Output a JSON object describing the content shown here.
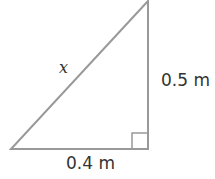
{
  "diagram": {
    "type": "right-triangle",
    "line_color": "#999999",
    "vertices": {
      "top": [
        148,
        1
      ],
      "bottom_left": [
        11,
        149
      ],
      "bottom_right": [
        148,
        149
      ]
    },
    "right_angle_at": "bottom_right",
    "labels": {
      "hypotenuse": "x",
      "vertical_side": "0.5 m",
      "base": "0.4 m"
    }
  }
}
